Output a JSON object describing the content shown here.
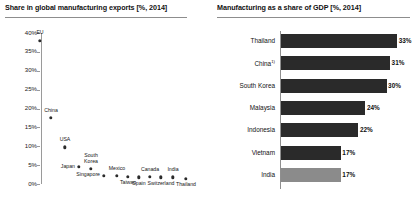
{
  "left_panel": {
    "title": "Share in global manufacturing exports [%, 2014]"
  },
  "right_panel": {
    "title": "Manufacturing as a share of GDP [%, 2014]"
  },
  "chart_data": [
    {
      "type": "scatter",
      "title": "Share in global manufacturing exports [%, 2014]",
      "xlabel": "",
      "ylabel": "",
      "ylim": [
        0,
        40
      ],
      "yticks": [
        "0%",
        "5%",
        "10%",
        "15%",
        "20%",
        "25%",
        "30%",
        "35%",
        "40%"
      ],
      "ytick_values": [
        0,
        5,
        10,
        15,
        20,
        25,
        30,
        35,
        40
      ],
      "grid": false,
      "legend": "none",
      "points": [
        {
          "label": "EU",
          "x": 1,
          "y": 38.0,
          "label_pos": "above"
        },
        {
          "label": "China",
          "x": 2,
          "y": 17.5,
          "label_pos": "above"
        },
        {
          "label": "USA",
          "x": 3,
          "y": 9.7,
          "label_pos": "above"
        },
        {
          "label": "Japan",
          "x": 4,
          "y": 4.5,
          "label_pos": "left"
        },
        {
          "label": "South\nKorea",
          "x": 5,
          "y": 4.0,
          "label_pos": "above"
        },
        {
          "label": "Singapore",
          "x": 6,
          "y": 2.2,
          "label_pos": "left"
        },
        {
          "label": "Mexico",
          "x": 7,
          "y": 2.2,
          "label_pos": "above"
        },
        {
          "label": "Taiwan",
          "x": 8,
          "y": 1.9,
          "label_pos": "below"
        },
        {
          "label": "Spain",
          "x": 9,
          "y": 1.8,
          "label_pos": "below"
        },
        {
          "label": "Canada",
          "x": 10,
          "y": 1.9,
          "label_pos": "above"
        },
        {
          "label": "Switzerland",
          "x": 11,
          "y": 1.8,
          "label_pos": "below"
        },
        {
          "label": "India",
          "x": 12,
          "y": 1.8,
          "label_pos": "above"
        },
        {
          "label": "Thailand",
          "x": 13,
          "y": 1.4,
          "label_pos": "below"
        }
      ]
    },
    {
      "type": "bar",
      "orientation": "horizontal",
      "title": "Manufacturing as a share of GDP [%, 2014]",
      "xlabel": "",
      "ylabel": "",
      "xlim": [
        0,
        40
      ],
      "grid": false,
      "legend": "none",
      "categories": [
        "Thailand",
        "China",
        "South Korea",
        "Malaysia",
        "Indonesia",
        "Vietnam",
        "India"
      ],
      "values": [
        33,
        31,
        30,
        24,
        22,
        17,
        17
      ],
      "value_labels": [
        "33%",
        "31%",
        "30%",
        "24%",
        "22%",
        "17%",
        "17%"
      ],
      "bars": [
        {
          "category": "Thailand",
          "footnote": "",
          "value": 33,
          "value_label": "33%",
          "highlight": false
        },
        {
          "category": "China",
          "footnote": "1)",
          "value": 31,
          "value_label": "31%",
          "highlight": false
        },
        {
          "category": "South Korea",
          "footnote": "",
          "value": 30,
          "value_label": "30%",
          "highlight": false
        },
        {
          "category": "Malaysia",
          "footnote": "",
          "value": 24,
          "value_label": "24%",
          "highlight": false
        },
        {
          "category": "Indonesia",
          "footnote": "",
          "value": 22,
          "value_label": "22%",
          "highlight": false
        },
        {
          "category": "Vietnam",
          "footnote": "",
          "value": 17,
          "value_label": "17%",
          "highlight": false
        },
        {
          "category": "India",
          "footnote": "",
          "value": 17,
          "value_label": "17%",
          "highlight": true
        }
      ]
    }
  ],
  "colors": {
    "bar_dark": "#2a2a2a",
    "bar_light": "#8b8b8b",
    "axis": "#8f8f8f",
    "text": "#111111"
  }
}
